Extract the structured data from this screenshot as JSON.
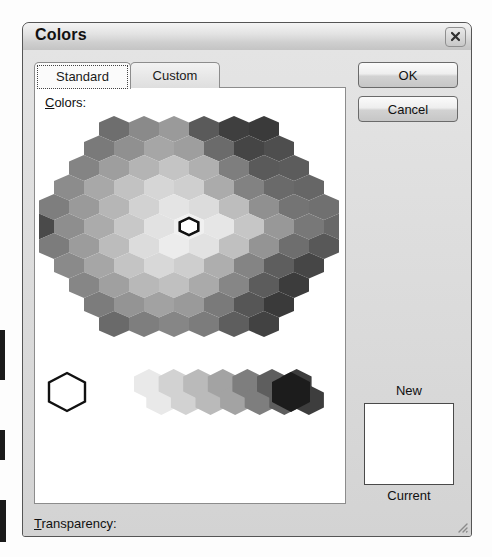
{
  "window": {
    "title": "Colors",
    "close_icon": "close-x-icon",
    "resize_grip_icon": "resize-grip-icon"
  },
  "tabs": [
    {
      "label": "Standard",
      "selected": true
    },
    {
      "label": "Custom",
      "selected": false
    }
  ],
  "colors_panel": {
    "label": "Colors:",
    "label_accel": "C",
    "selection_marker_icon": "hex-selection-icon",
    "selected_swatch": "#ffffff"
  },
  "transparency": {
    "label": "Transparency:",
    "label_accel": "T",
    "value": "0 %",
    "slider_position_percent": 0,
    "left_arrow_icon": "arrow-left-icon",
    "right_arrow_icon": "arrow-right-icon",
    "spin_up_icon": "spin-up-icon",
    "spin_down_icon": "spin-down-icon"
  },
  "buttons": {
    "ok": "OK",
    "cancel": "Cancel"
  },
  "preview": {
    "new_label": "New",
    "current_label": "Current",
    "new_color": "#ffffff",
    "current_color": "#ffffff"
  },
  "palette": {
    "note": "Office standard-colors honeycomb rendered in grayscale. Rows top-to-bottom, each row is a list of hex fills left-to-right.",
    "hex_width": 30,
    "hex_height": 26,
    "row_step": 19.5,
    "rows": [
      {
        "indent": 4,
        "cells": [
          "#6e6e6e",
          "#8a8a8a",
          "#9a9a9a",
          "#5a5a5a",
          "#3f3f3f",
          "#3a3a3a"
        ]
      },
      {
        "indent": 3,
        "cells": [
          "#7a7a7a",
          "#909090",
          "#a6a6a6",
          "#9e9e9e",
          "#6b6b6b",
          "#454545",
          "#4e4e4e"
        ]
      },
      {
        "indent": 2,
        "cells": [
          "#848484",
          "#9e9e9e",
          "#b4b4b4",
          "#c4c4c4",
          "#b0b0b0",
          "#7e7e7e",
          "#5a5a5a",
          "#5c5c5c"
        ]
      },
      {
        "indent": 1,
        "cells": [
          "#8c8c8c",
          "#a8a8a8",
          "#c2c2c2",
          "#d6d6d6",
          "#cfcfcf",
          "#ababab",
          "#828282",
          "#6a6a6a",
          "#666666"
        ]
      },
      {
        "indent": 0,
        "cells": [
          "#7e7e7e",
          "#9a9a9a",
          "#b6b6b6",
          "#d2d2d2",
          "#e4e4e4",
          "#dcdcdc",
          "#bdbdbd",
          "#909090",
          "#747474",
          "#707070"
        ]
      },
      {
        "indent": 0,
        "cells": [
          "#4a4a4a",
          "#8e8e8e",
          "#ababab",
          "#c8c8c8",
          "#e2e2e2",
          "#f0f0f0",
          "#e6e6e6",
          "#c6c6c6",
          "#989898",
          "#787878",
          "#686868"
        ]
      },
      {
        "indent": 0,
        "cells": [
          "#7c7c7c",
          "#9c9c9c",
          "#bcbcbc",
          "#dcdcdc",
          "#ececec",
          "#e2e2e2",
          "#c0c0c0",
          "#949494",
          "#6e6e6e",
          "#585858"
        ]
      },
      {
        "indent": 1,
        "cells": [
          "#8a8a8a",
          "#a6a6a6",
          "#c4c4c4",
          "#d8d8d8",
          "#cecece",
          "#aeaeae",
          "#848484",
          "#5e5e5e",
          "#464646"
        ]
      },
      {
        "indent": 2,
        "cells": [
          "#868686",
          "#a0a0a0",
          "#b8b8b8",
          "#c0c0c0",
          "#aaaaaa",
          "#868686",
          "#5c5c5c",
          "#3c3c3c"
        ]
      },
      {
        "indent": 3,
        "cells": [
          "#7c7c7c",
          "#949494",
          "#a2a2a2",
          "#9a9a9a",
          "#7a7a7a",
          "#565656",
          "#3a3a3a"
        ]
      },
      {
        "indent": 4,
        "cells": [
          "#6a6a6a",
          "#7e7e7e",
          "#868686",
          "#7c7c7c",
          "#5e5e5e",
          "#424242"
        ]
      }
    ],
    "gray_ramp": {
      "white_swatch": "#ffffff",
      "ramp": [
        "#e9e9e9",
        "#d2d2d2",
        "#bababa",
        "#a3a3a3",
        "#7e7e7e",
        "#5e5e5e",
        "#3d3d3d"
      ],
      "black_swatch": "#1c1c1c"
    }
  }
}
